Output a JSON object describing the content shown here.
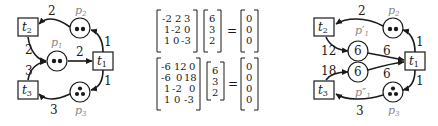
{
  "left_net": {
    "transitions": {
      "t1": "t",
      "t2": "t",
      "t3": "t"
    },
    "transition_subs": {
      "t1": "1",
      "t2": "2",
      "t3": "3"
    },
    "places": {
      "p1": "p",
      "p2": "p",
      "p3": "p"
    },
    "place_subs": {
      "p1": "1",
      "p2": "2",
      "p3": "3"
    },
    "tokens": {
      "p1": 2,
      "p2": 2,
      "p3": 3
    },
    "arc_weights": {
      "p2_t2": "2",
      "t2_p1": "2",
      "p1_t1": "2",
      "t1_p2": "1",
      "t1_p3": "1",
      "t3_p1": "3",
      "p3_t3": "3"
    }
  },
  "equations": {
    "eq1": {
      "matrix": [
        [
          "-2",
          "2",
          "3"
        ],
        [
          "1",
          "-2",
          "0"
        ],
        [
          "1",
          "0",
          "-3"
        ]
      ],
      "vector": [
        "6",
        "3",
        "2"
      ],
      "equals": "=",
      "result": [
        "0",
        "0",
        "0"
      ]
    },
    "eq2": {
      "matrix": [
        [
          "-6",
          "12",
          "0"
        ],
        [
          "-6",
          "0",
          "18"
        ],
        [
          "1",
          "-2",
          "0"
        ],
        [
          "1",
          "0",
          "-3"
        ]
      ],
      "vector": [
        "6",
        "3",
        "2"
      ],
      "equals": "=",
      "result": [
        "0",
        "0",
        "0",
        "0"
      ]
    }
  },
  "right_net": {
    "transition_subs": {
      "t1": "1",
      "t2": "2",
      "t3": "3"
    },
    "place_labels": {
      "p1a": "p′",
      "p1b": "p″",
      "p2": "p",
      "p3": "p"
    },
    "place_subs": {
      "p1a": "1",
      "p1b": "1",
      "p2": "2",
      "p3": "3"
    },
    "place_values": {
      "p1a": "6",
      "p1b": "6"
    },
    "arc_weights": {
      "p2_t2": "2",
      "t2_p1a": "12",
      "p1a_t1": "6",
      "t3_p1b": "18",
      "p1b_t1": "6",
      "t1_p2": "1",
      "t1_p3": "1",
      "p3_t3": "3"
    }
  }
}
